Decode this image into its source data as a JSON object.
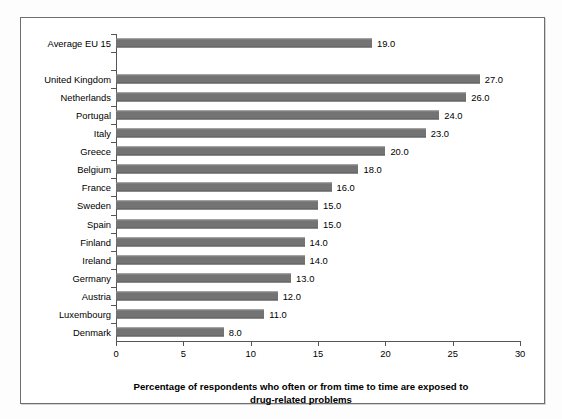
{
  "chart_data": {
    "type": "bar",
    "orientation": "horizontal",
    "title": "",
    "xlabel": "Percentage of respondents who often or from time to time are exposed to drug-related problems",
    "xlabel_line1": "Percentage of respondents who often or from time to time are exposed to",
    "xlabel_line2": "drug-related problems",
    "ylabel": "",
    "xlim": [
      0,
      30
    ],
    "xticks": [
      0,
      5,
      10,
      15,
      20,
      25,
      30
    ],
    "xtick_labels": [
      "0",
      "5",
      "10",
      "15",
      "20",
      "25",
      "30"
    ],
    "grid": false,
    "legend": null,
    "bar_color": "#737373",
    "value_label_format": "one-decimal",
    "categories": [
      "Average EU 15",
      "",
      "United Kingdom",
      "Netherlands",
      "Portugal",
      "Italy",
      "Greece",
      "Belgium",
      "France",
      "Sweden",
      "Spain",
      "Finland",
      "Ireland",
      "Germany",
      "Austria",
      "Luxembourg",
      "Denmark"
    ],
    "values": [
      19.0,
      null,
      27.0,
      26.0,
      24.0,
      23.0,
      20.0,
      18.0,
      16.0,
      15.0,
      15.0,
      14.0,
      14.0,
      13.0,
      12.0,
      11.0,
      8.0
    ],
    "value_labels": [
      "19.0",
      "",
      "27.0",
      "26.0",
      "24.0",
      "23.0",
      "20.0",
      "18.0",
      "16.0",
      "15.0",
      "15.0",
      "14.0",
      "14.0",
      "13.0",
      "12.0",
      "11.0",
      "8.0"
    ],
    "rows": [
      {
        "label": "Average EU 15",
        "value": 19.0,
        "value_label": "19.0"
      },
      {
        "label": "",
        "value": null,
        "value_label": ""
      },
      {
        "label": "United Kingdom",
        "value": 27.0,
        "value_label": "27.0"
      },
      {
        "label": "Netherlands",
        "value": 26.0,
        "value_label": "26.0"
      },
      {
        "label": "Portugal",
        "value": 24.0,
        "value_label": "24.0"
      },
      {
        "label": "Italy",
        "value": 23.0,
        "value_label": "23.0"
      },
      {
        "label": "Greece",
        "value": 20.0,
        "value_label": "20.0"
      },
      {
        "label": "Belgium",
        "value": 18.0,
        "value_label": "18.0"
      },
      {
        "label": "France",
        "value": 16.0,
        "value_label": "16.0"
      },
      {
        "label": "Sweden",
        "value": 15.0,
        "value_label": "15.0"
      },
      {
        "label": "Spain",
        "value": 15.0,
        "value_label": "15.0"
      },
      {
        "label": "Finland",
        "value": 14.0,
        "value_label": "14.0"
      },
      {
        "label": "Ireland",
        "value": 14.0,
        "value_label": "14.0"
      },
      {
        "label": "Germany",
        "value": 13.0,
        "value_label": "13.0"
      },
      {
        "label": "Austria",
        "value": 12.0,
        "value_label": "12.0"
      },
      {
        "label": "Luxembourg",
        "value": 11.0,
        "value_label": "11.0"
      },
      {
        "label": "Denmark",
        "value": 8.0,
        "value_label": "8.0"
      }
    ]
  }
}
